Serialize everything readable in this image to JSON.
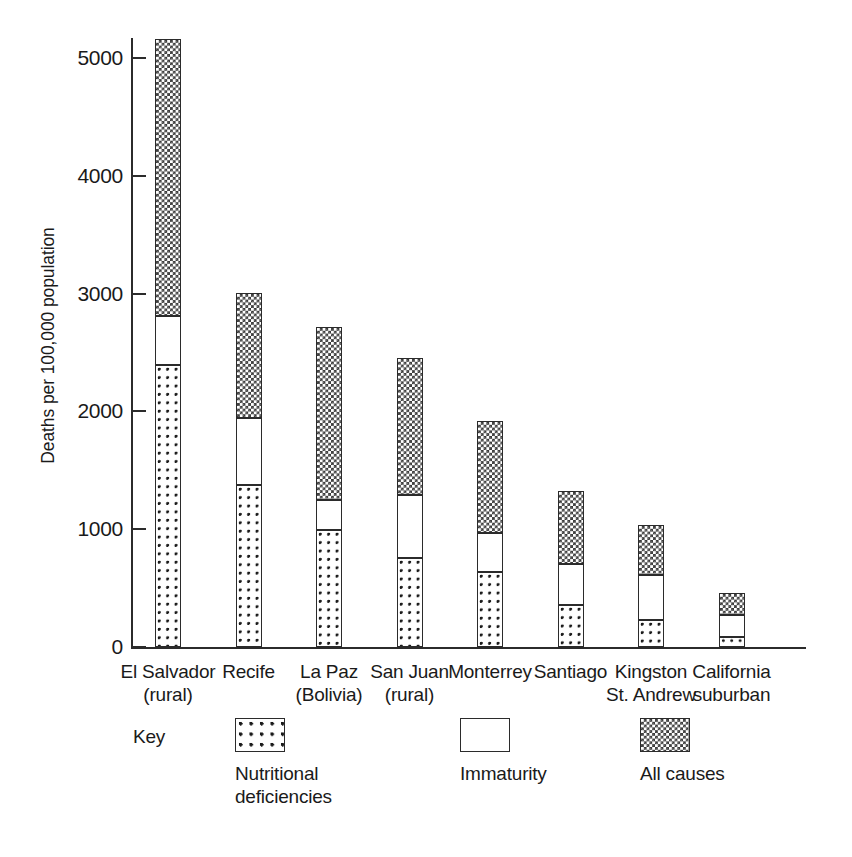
{
  "chart_data": {
    "type": "bar",
    "subtype": "stacked-bar",
    "title": "",
    "xlabel": "",
    "ylabel": "Deaths per 100,000 population",
    "ylim": [
      0,
      5400
    ],
    "yticks": [
      0,
      1000,
      2000,
      3000,
      4000,
      5000
    ],
    "ytick_labels": [
      "0",
      "1000",
      "2000",
      "3000",
      "4000",
      "5000"
    ],
    "grid": false,
    "legend_position": "below-axes",
    "legend_title": "Key",
    "categories": [
      "El Salvador (rural)",
      "Recife",
      "La Paz (Bolivia)",
      "San Juan (rural)",
      "Monterrey",
      "Santiago",
      "Kingston St. Andrew",
      "California suburban"
    ],
    "category_lines": [
      [
        "El Salvador",
        "(rural)"
      ],
      [
        "Recife",
        ""
      ],
      [
        "La Paz",
        "(Bolivia)"
      ],
      [
        "San Juan",
        "(rural)"
      ],
      [
        "Monterrey",
        ""
      ],
      [
        "Santiago",
        ""
      ],
      [
        "Kingston",
        "St. Andrew"
      ],
      [
        "California",
        "suburban"
      ]
    ],
    "series": [
      {
        "name": "Nutritional deficiencies",
        "pattern": "dots",
        "values": [
          2395,
          1375,
          995,
          755,
          635,
          355,
          230,
          85
        ]
      },
      {
        "name": "Immaturity",
        "pattern": "plain",
        "values": [
          415,
          570,
          255,
          535,
          335,
          350,
          380,
          190
        ]
      },
      {
        "name": "All causes",
        "pattern": "checker",
        "values": [
          2350,
          1060,
          1470,
          1165,
          950,
          620,
          425,
          185
        ]
      }
    ],
    "totals": [
      5160,
      3005,
      2720,
      2455,
      1920,
      1325,
      1035,
      460
    ],
    "colors": {
      "ink": "#1a1a1a",
      "axis": "#2b2b2b",
      "pattern_fill": "#3a3a3a",
      "background": "#ffffff"
    }
  },
  "axis": {
    "y_title": "Deaths per 100,000 population"
  },
  "key": {
    "title": "Key",
    "entries": [
      {
        "label_line1": "Nutritional",
        "label_line2": "deficiencies",
        "pattern": "dots"
      },
      {
        "label_line1": "Immaturity",
        "label_line2": "",
        "pattern": "plain"
      },
      {
        "label_line1": "All causes",
        "label_line2": "",
        "pattern": "checker"
      }
    ]
  },
  "artifact": {
    "corner_mark": ""
  }
}
